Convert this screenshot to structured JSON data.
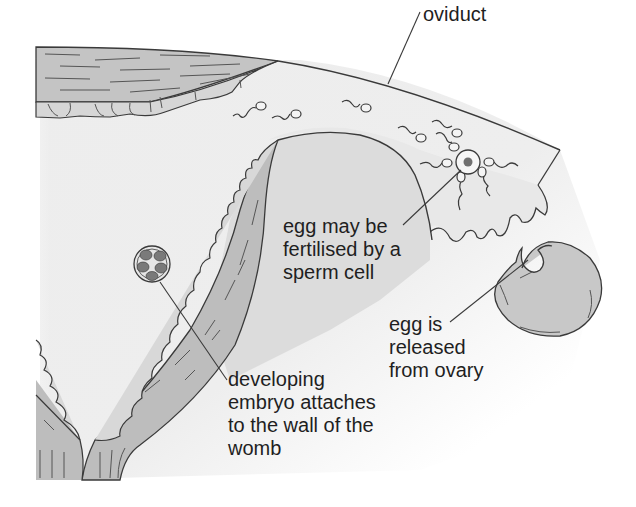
{
  "diagram": {
    "colors": {
      "tissue_fill": "#c4c4c4",
      "cavity_fill": "#dcdcdc",
      "background_haze": "#eeeeee",
      "outline": "#3a3a3a",
      "nucleus": "#707070",
      "embryo_cells": "#7a7a7a",
      "text": "#1f1f1f"
    },
    "labels": {
      "oviduct": "oviduct",
      "fertilisation": "egg may be\nfertilised by a\nsperm cell",
      "release": "egg is\nreleased\nfrom ovary",
      "embryo": "developing\nembryo attaches\nto the wall of the\nwomb"
    },
    "structures": [
      "oviduct",
      "sperm cells",
      "egg",
      "ovary",
      "womb wall",
      "developing embryo"
    ]
  }
}
